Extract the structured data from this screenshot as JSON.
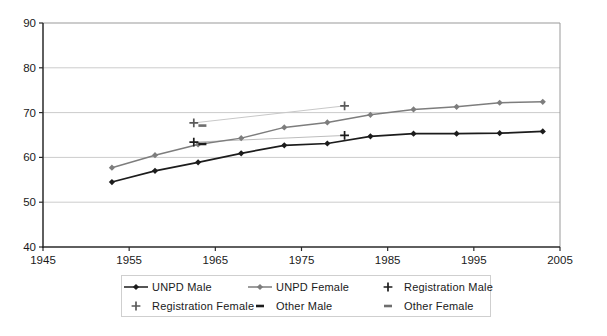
{
  "chart_data": {
    "type": "line",
    "title": "",
    "xlabel": "",
    "ylabel": "",
    "axes": {
      "xlim": [
        1945,
        2005
      ],
      "ylim": [
        40,
        90
      ],
      "x_ticks": [
        1945,
        1955,
        1965,
        1975,
        1985,
        1995,
        2005
      ],
      "y_ticks": [
        40,
        50,
        60,
        70,
        80,
        90
      ],
      "grid": "horizontal-only",
      "gridline_color": "#cccccc",
      "axis_color": "#2a2a2a",
      "border_color": "#999999"
    },
    "legend_position": "bottom",
    "unpd_years": [
      1953,
      1958,
      1963,
      1968,
      1973,
      1978,
      1983,
      1988,
      1993,
      1998,
      2003
    ],
    "series": [
      {
        "name": "UNPD Male",
        "kind": "line",
        "marker": "diamond",
        "color": "#1c1c1c",
        "values": [
          54.5,
          57.0,
          58.9,
          60.9,
          62.7,
          63.1,
          64.7,
          65.3,
          65.3,
          65.4,
          65.8
        ]
      },
      {
        "name": "UNPD Female",
        "kind": "line",
        "marker": "diamond",
        "color": "#7d7d7d",
        "values": [
          57.7,
          60.5,
          62.9,
          64.3,
          66.7,
          67.8,
          69.5,
          70.7,
          71.3,
          72.2,
          72.4
        ]
      },
      {
        "name": "Registration Male",
        "kind": "points",
        "marker": "plus",
        "color": "#1c1c1c",
        "connector_color": "#bdbdbd",
        "points": [
          [
            1962.5,
            63.4
          ],
          [
            1980,
            64.9
          ]
        ]
      },
      {
        "name": "Registration Female",
        "kind": "points",
        "marker": "plus",
        "color": "#5a5a5a",
        "connector_color": "#c8c8c8",
        "points": [
          [
            1962.5,
            67.7
          ],
          [
            1980,
            71.5
          ]
        ]
      },
      {
        "name": "Other Male",
        "kind": "points",
        "marker": "dash",
        "color": "#1c1c1c",
        "points": [
          [
            1963.5,
            63.0
          ]
        ]
      },
      {
        "name": "Other Female",
        "kind": "points",
        "marker": "dash",
        "color": "#6e6e6e",
        "points": [
          [
            1963.5,
            67.1
          ]
        ]
      }
    ]
  }
}
